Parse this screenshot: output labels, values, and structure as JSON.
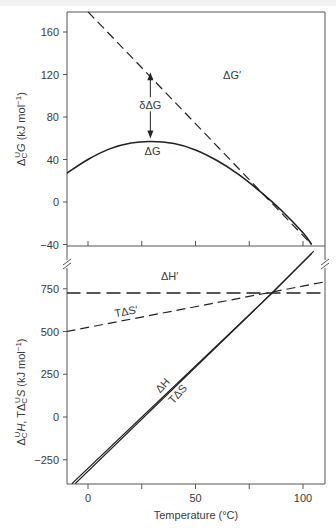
{
  "chart_data": {
    "type": "line",
    "xlabel": "Temperature (°C)",
    "xlim": [
      -10,
      110
    ],
    "xticks": [
      0,
      50,
      100
    ],
    "xminor_ticks": [
      25,
      75
    ],
    "panels": [
      {
        "name": "top",
        "ylabel": "ΔᶜU G (kJ mol⁻¹)",
        "ylabel_parts": {
          "delta": "Δ",
          "sup": "U",
          "sub": "C",
          "var": "G",
          "unit": " (kJ mol",
          "unit_exp": "−1",
          "unit_close": ")"
        },
        "ylim": [
          -40,
          180
        ],
        "yticks": [
          160,
          120,
          80,
          40,
          0,
          -40
        ],
        "series": [
          {
            "name": "ΔG",
            "style": "solid",
            "x": [
              -10,
              0,
              10,
              20,
              29,
              40,
              50,
              60,
              70,
              80,
              90,
              100,
              104
            ],
            "y": [
              27,
              40,
              50,
              55.5,
              57,
              55,
              49,
              39,
              26,
              10,
              -8,
              -29,
              -40
            ]
          },
          {
            "name": "ΔG′",
            "style": "dashed",
            "x": [
              0,
              104
            ],
            "y": [
              179,
              -40
            ]
          }
        ],
        "annotations": [
          {
            "text": "δΔG",
            "type": "double-arrow",
            "x": 29,
            "y_from": 57,
            "y_to": 125
          },
          {
            "text": "ΔG′",
            "x": 67,
            "y": 116
          },
          {
            "text": "ΔG",
            "x": 30,
            "y": 44
          }
        ]
      },
      {
        "name": "bottom",
        "ylabel": "ΔᶜU H, TΔᶜU S (kJ mol⁻¹)",
        "ylim": [
          -390,
          830
        ],
        "yticks": [
          750,
          500,
          250,
          0,
          -250
        ],
        "series": [
          {
            "name": "ΔH′",
            "style": "long-dashed",
            "x": [
              -10,
              110
            ],
            "y": [
              725,
              725
            ]
          },
          {
            "name": "TΔS′",
            "style": "dashed",
            "x": [
              -10,
              110
            ],
            "y": [
              500,
              790
            ]
          },
          {
            "name": "ΔH",
            "style": "solid",
            "x": [
              -7.5,
              85.6,
              104
            ],
            "y": [
              -390,
              725,
              955
            ]
          },
          {
            "name": "TΔS",
            "style": "solid",
            "x": [
              -6,
              85.6,
              105
            ],
            "y": [
              -390,
              725,
              970
            ]
          }
        ],
        "annotations": [
          {
            "text": "ΔH′",
            "x": 38,
            "y": 800
          },
          {
            "text": "TΔS′",
            "x": 18,
            "y": 595
          },
          {
            "text": "ΔH",
            "x": 36,
            "y": 170
          },
          {
            "text": "TΔS",
            "x": 43,
            "y": 120
          }
        ]
      }
    ],
    "axis_break": true
  }
}
